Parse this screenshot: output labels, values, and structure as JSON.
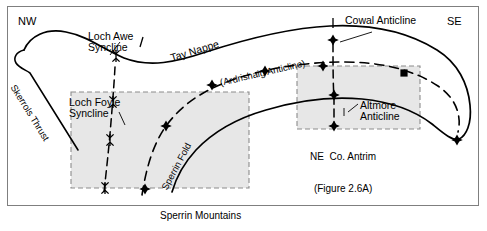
{
  "figure": {
    "type": "structural-geology-cross-section",
    "orientation_labels": {
      "left": "NW",
      "right": "SE"
    },
    "caption_faint": "",
    "colors": {
      "frame": "#7f7f7f",
      "line": "#000000",
      "shaded_box_fill": "#e6e6e6",
      "shaded_box_border": "#8c8c8c",
      "background": "#ffffff"
    }
  },
  "labels": {
    "tay_nappe": "Tay Nappe",
    "skerrols_thrust": "Skerrols Thrust",
    "ardrishaig_anticline": "(Ardrishaig Anticline)",
    "sperrin_fold": "Sperrin Fold",
    "loch_awe_syncline": "Loch Awe\nSyncline",
    "loch_foyle_syncline": "Loch Foyle\nSyncline",
    "cowal_anticline": "Cowal Anticline",
    "altmore_anticline": "Altmore\nAnticline"
  },
  "inset_boxes": [
    {
      "id": "sperrin-mountains",
      "title": "Sperrin Mountains",
      "figure_ref": "(Figure 2.5)"
    },
    {
      "id": "ne-co-antrim",
      "title": "NE  Co. Antrim",
      "figure_ref": "(Figure 2.6A)"
    }
  ],
  "symbols": {
    "anticline": "anticline-axis-marker",
    "syncline": "syncline-axis-marker"
  }
}
